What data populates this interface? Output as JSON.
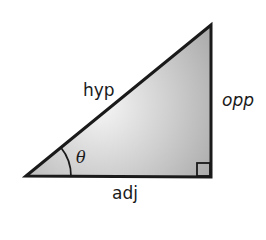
{
  "diagram": {
    "type": "right-triangle",
    "labels": {
      "hypotenuse": "hyp",
      "opposite": "opp",
      "adjacent": "adj",
      "angle": "θ"
    },
    "vertices": {
      "angle_vertex": [
        26,
        176
      ],
      "top_vertex": [
        211,
        25
      ],
      "right_angle_vertex": [
        211,
        177
      ]
    },
    "colors": {
      "stroke": "#1a1a1a",
      "fill_light": "#f4f4f4",
      "fill_dark": "#a8a8a8",
      "background": "#ffffff"
    }
  }
}
